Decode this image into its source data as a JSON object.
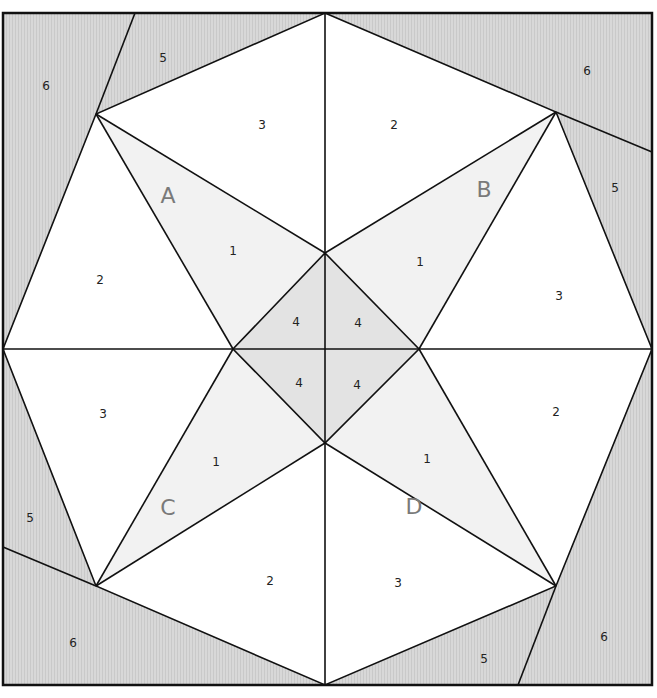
{
  "colors": {
    "background_fabric": "#d6d6d6",
    "star_point_fabric": "#f2f2f2",
    "center_fabric": "#e4e4e4",
    "white_fabric": "#ffffff",
    "line": "#111111",
    "section_letter": "#7a7a7a"
  },
  "sections": [
    {
      "letter": "A",
      "letter_pos": [
        168,
        197
      ],
      "pieces": [
        {
          "num": "1",
          "pos": [
            233,
            251
          ],
          "fill": "star_point"
        },
        {
          "num": "2",
          "pos": [
            100,
            280
          ],
          "fill": "white"
        },
        {
          "num": "3",
          "pos": [
            262,
            125
          ],
          "fill": "white"
        },
        {
          "num": "4",
          "pos": [
            296,
            322
          ],
          "fill": "center"
        },
        {
          "num": "5",
          "pos": [
            163,
            58
          ],
          "fill": "background"
        },
        {
          "num": "6",
          "pos": [
            46,
            86
          ],
          "fill": "background"
        }
      ]
    },
    {
      "letter": "B",
      "letter_pos": [
        484,
        191
      ],
      "pieces": [
        {
          "num": "1",
          "pos": [
            420,
            262
          ],
          "fill": "star_point"
        },
        {
          "num": "2",
          "pos": [
            394,
            125
          ],
          "fill": "white"
        },
        {
          "num": "3",
          "pos": [
            559,
            296
          ],
          "fill": "white"
        },
        {
          "num": "4",
          "pos": [
            358,
            323
          ],
          "fill": "center"
        },
        {
          "num": "5",
          "pos": [
            615,
            188
          ],
          "fill": "background"
        },
        {
          "num": "6",
          "pos": [
            587,
            71
          ],
          "fill": "background"
        }
      ]
    },
    {
      "letter": "C",
      "letter_pos": [
        168,
        509
      ],
      "pieces": [
        {
          "num": "1",
          "pos": [
            216,
            462
          ],
          "fill": "star_point"
        },
        {
          "num": "2",
          "pos": [
            270,
            581
          ],
          "fill": "white"
        },
        {
          "num": "3",
          "pos": [
            103,
            414
          ],
          "fill": "white"
        },
        {
          "num": "4",
          "pos": [
            299,
            383
          ],
          "fill": "center"
        },
        {
          "num": "5",
          "pos": [
            30,
            518
          ],
          "fill": "background"
        },
        {
          "num": "6",
          "pos": [
            73,
            643
          ],
          "fill": "background"
        }
      ]
    },
    {
      "letter": "D",
      "letter_pos": [
        414,
        508
      ],
      "pieces": [
        {
          "num": "1",
          "pos": [
            427,
            459
          ],
          "fill": "star_point"
        },
        {
          "num": "2",
          "pos": [
            556,
            412
          ],
          "fill": "white"
        },
        {
          "num": "3",
          "pos": [
            398,
            583
          ],
          "fill": "white"
        },
        {
          "num": "4",
          "pos": [
            357,
            385
          ],
          "fill": "center"
        },
        {
          "num": "5",
          "pos": [
            484,
            659
          ],
          "fill": "background"
        },
        {
          "num": "6",
          "pos": [
            604,
            637
          ],
          "fill": "background"
        }
      ]
    }
  ]
}
